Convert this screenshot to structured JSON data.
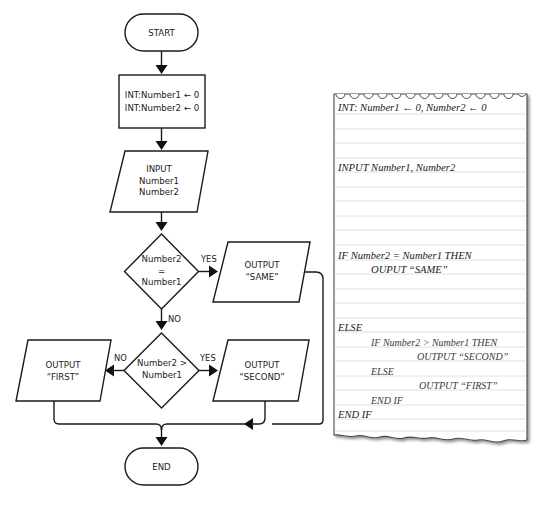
{
  "flowchart": {
    "start": {
      "label": "START"
    },
    "declare": {
      "lines": [
        "INT:Number1 ← 0",
        "INT:Number2 ← 0"
      ]
    },
    "input": {
      "lines": [
        "INPUT",
        "Number1",
        "Number2"
      ]
    },
    "decision1": {
      "lines": [
        "Number2",
        "=",
        "Number1"
      ],
      "yes_label": "YES",
      "no_label": "NO"
    },
    "output_same": {
      "lines": [
        "OUTPUT",
        "“SAME”"
      ]
    },
    "decision2": {
      "lines": [
        "Number2 >",
        "Number1"
      ],
      "yes_label": "YES",
      "no_label": "NO"
    },
    "output_first": {
      "lines": [
        "OUTPUT",
        "“FIRST”"
      ]
    },
    "output_second": {
      "lines": [
        "OUTPUT",
        "“SECOND”"
      ]
    },
    "end": {
      "label": "END"
    }
  },
  "pseudocode": {
    "lines": [
      "INT: Number1 ← 0, Number2 ← 0",
      "INPUT Number1, Number2",
      "IF Number2 = Number1 THEN",
      "OUPUT “SAME”",
      "ELSE",
      "IF Number2 > Number1 THEN",
      "OUTPUT “SECOND”",
      "ELSE",
      "OUTPUT “FIRST”",
      "END IF",
      "END IF"
    ]
  },
  "colors": {
    "stroke": "#1a1a1a",
    "paper_line": "#d9d9d9",
    "paper_edge": "#555555"
  }
}
